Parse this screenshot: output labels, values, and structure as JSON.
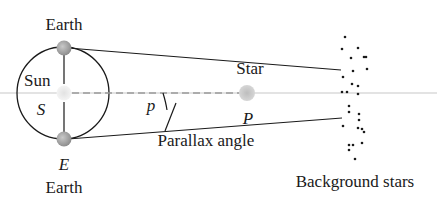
{
  "diagram": {
    "labels": {
      "earth_top": "Earth",
      "earth_bottom": "Earth",
      "sun": "Sun",
      "sun_symbol": "S",
      "earth_symbol": "E",
      "star": "Star",
      "star_symbol": "P",
      "angle_symbol": "p",
      "parallax_angle": "Parallax angle",
      "background_stars": "Background stars"
    },
    "colors": {
      "line": "#1a1a1a",
      "dashed_axis": "#9a9a9a",
      "body_fill": "#a8a8a8",
      "sun_fill": "#d8d8d8",
      "star_fill": "#c4c4c4",
      "dots": "#1a1a1a"
    },
    "geometry": {
      "orbit": {
        "cx": 63,
        "cy": 93,
        "r": 46
      },
      "earth_top": {
        "x": 64,
        "y": 47
      },
      "earth_bottom": {
        "x": 64,
        "y": 140
      },
      "sun": {
        "x": 64,
        "y": 93
      },
      "star": {
        "x": 247,
        "y": 93
      }
    },
    "background_star_points": [
      [
        345,
        37
      ],
      [
        342,
        49
      ],
      [
        358,
        48
      ],
      [
        351,
        58
      ],
      [
        364,
        57
      ],
      [
        366,
        57
      ],
      [
        353,
        71
      ],
      [
        367,
        69
      ],
      [
        343,
        77
      ],
      [
        352,
        84
      ],
      [
        358,
        86
      ],
      [
        342,
        92
      ],
      [
        347,
        92
      ],
      [
        358,
        94
      ],
      [
        349,
        106
      ],
      [
        349,
        112
      ],
      [
        359,
        114
      ],
      [
        343,
        126
      ],
      [
        359,
        120
      ],
      [
        358,
        128
      ],
      [
        362,
        129
      ],
      [
        364,
        132
      ],
      [
        349,
        145
      ],
      [
        353,
        145
      ],
      [
        349,
        150
      ],
      [
        362,
        143
      ],
      [
        355,
        159
      ]
    ]
  }
}
